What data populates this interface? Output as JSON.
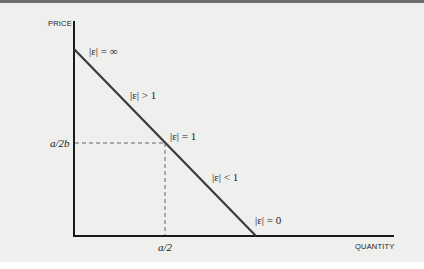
{
  "diagram": {
    "axes": {
      "y_label": "PRICE",
      "x_label": "QUANTITY"
    },
    "ticks": {
      "y_mid": "a/2b",
      "x_mid": "a/2"
    },
    "regions": [
      {
        "id": "top",
        "label": "|ε| = ∞"
      },
      {
        "id": "upper",
        "label": "|ε| > 1"
      },
      {
        "id": "mid",
        "label": "|ε| = 1"
      },
      {
        "id": "lower",
        "label": "|ε| < 1"
      },
      {
        "id": "bottom",
        "label": "|ε| = 0"
      }
    ],
    "colors": {
      "line": "#3a3a3a",
      "axis": "#1a1a1a",
      "dashed": "#555555",
      "background": "#efefee"
    }
  }
}
